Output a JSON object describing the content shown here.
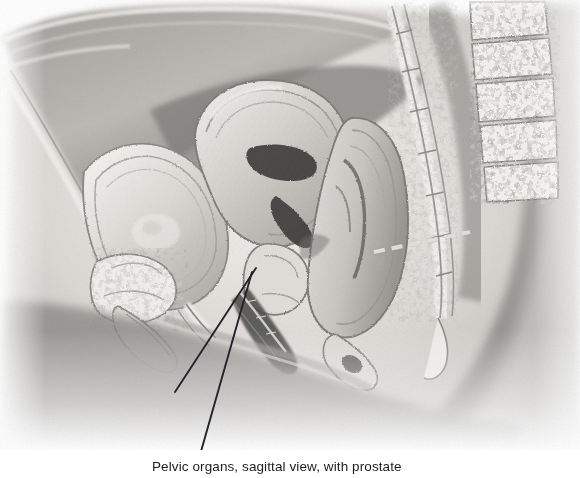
{
  "figure": {
    "kind": "medical-illustration",
    "view": "midsagittal section of the female pelvis",
    "palette": {
      "background": "#ffffff",
      "ink": "#1c1c22",
      "soft_tissue_light": "#e9e7e4",
      "soft_tissue_mid": "#bdbab6",
      "soft_tissue_dark": "#8d8a87",
      "shadow": "#6e6c6a",
      "bone_light": "#f3f1ee",
      "lumen_dark": "#3a3836",
      "leader_line": "#23232b",
      "dashed_marker": "#ffffff"
    },
    "annotations": {
      "leader_lines": [
        {
          "name": "leader-line-upper",
          "x1": 256,
          "y1": 268,
          "x2": 175,
          "y2": 392
        },
        {
          "name": "leader-line-lower",
          "x1": 252,
          "y1": 272,
          "x2": 198,
          "y2": 462
        }
      ],
      "dashed_marker": {
        "name": "rectal-plane-dashed-line",
        "x1": 374,
        "y1": 252,
        "x2": 470,
        "y2": 232,
        "dash": "11 7"
      }
    }
  },
  "caption": {
    "text": "Pelvic organs, sagittal view, with prostate",
    "clipped": true
  }
}
